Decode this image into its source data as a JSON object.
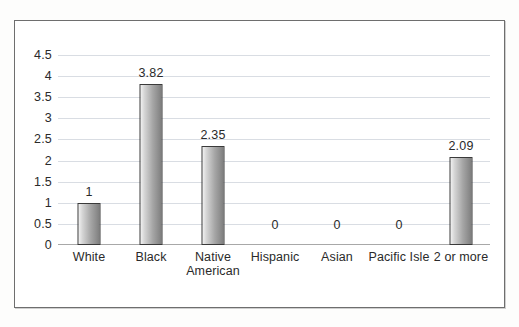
{
  "chart_data": {
    "type": "bar",
    "title": "",
    "subtitle": "",
    "xlabel": "",
    "ylabel": "",
    "categories": [
      "White",
      "Black",
      "Native American",
      "Hispanic",
      "Asian",
      "Pacific Isle",
      "2 or more"
    ],
    "category_lines": [
      [
        "White"
      ],
      [
        "Black"
      ],
      [
        "Native",
        "American"
      ],
      [
        "Hispanic"
      ],
      [
        "Asian"
      ],
      [
        "Pacific Isle"
      ],
      [
        "2 or more"
      ]
    ],
    "values": [
      1,
      3.82,
      2.35,
      0,
      0,
      0,
      2.09
    ],
    "value_labels": [
      "1",
      "3.82",
      "2.35",
      "0",
      "0",
      "0",
      "2.09"
    ],
    "ylim": [
      0,
      4.5
    ],
    "yticks": [
      0,
      0.5,
      1,
      1.5,
      2,
      2.5,
      3,
      3.5,
      4,
      4.5
    ],
    "ytick_labels": [
      "0",
      "0.5",
      "1",
      "1.5",
      "2",
      "2.5",
      "3",
      "3.5",
      "4",
      "4.5"
    ],
    "grid": true,
    "legend": null,
    "legend_position": "none",
    "bar_fill_light": "#f2f2f2",
    "bar_fill_dark": "#7e7e7e",
    "bar_border_color": "#3a3a3a",
    "gridline_color": "#d9dde3",
    "axis_color": "#a8a8a8",
    "text_color": "#2a2a2a",
    "frame_color": "#6e6e6e",
    "background_color": "#ffffff"
  }
}
